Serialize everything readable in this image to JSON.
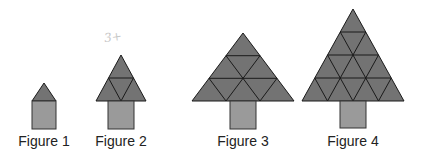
{
  "figures": [
    {
      "label": "Figure 1",
      "rows": 1,
      "triangles": 1
    },
    {
      "label": "Figure 2",
      "rows": 2,
      "triangles": 4
    },
    {
      "label": "Figure 3",
      "rows": 3,
      "triangles": 9
    },
    {
      "label": "Figure 4",
      "rows": 4,
      "triangles": 16
    }
  ],
  "annotation": "3+",
  "colors": {
    "triangle_fill": "#737373",
    "trunk_fill": "#9a9a9a",
    "stroke": "#1a1a1a",
    "label_text": "#222222"
  }
}
